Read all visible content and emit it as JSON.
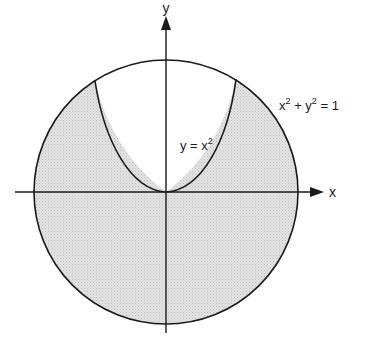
{
  "diagram": {
    "axes": {
      "x_label": "x",
      "y_label": "y"
    },
    "curves": {
      "circle": {
        "label_base_x": "x",
        "label_exp_x": "2",
        "label_plus": " + ",
        "label_base_y": "y",
        "label_exp_y": "2",
        "label_rhs": " = 1"
      },
      "parabola": {
        "label_lhs": "y = x",
        "label_exp": "2"
      }
    },
    "colors": {
      "stroke": "#1a1a1a",
      "shaded_region": "#d9d9d9",
      "background": "#ffffff"
    }
  }
}
